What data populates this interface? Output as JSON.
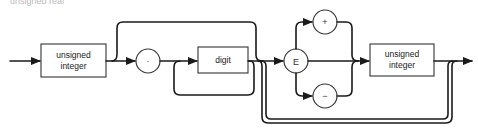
{
  "diagram": {
    "type": "syntax-diagram",
    "title_fragment": "unsigned real",
    "nodes": {
      "first_integer": {
        "line1": "unsigned",
        "line2": "integer"
      },
      "decimal_point": {
        "symbol": "."
      },
      "digit": {
        "label": "digit"
      },
      "exponent": {
        "symbol": "E"
      },
      "plus": {
        "symbol": "+"
      },
      "minus": {
        "symbol": "−"
      },
      "second_integer": {
        "line1": "unsigned",
        "line2": "integer"
      }
    },
    "colors": {
      "line": "#1a1a1a",
      "box_stroke": "#333333",
      "background": "#ffffff"
    }
  }
}
